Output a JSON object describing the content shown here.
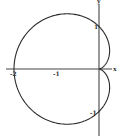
{
  "chart_data": {
    "type": "line",
    "title": "",
    "subtitle": "",
    "xlabel": "x",
    "ylabel": "y",
    "equation": "r = 1 - cos(theta)",
    "x_ticks": [
      {
        "value": -2,
        "label": "-2"
      },
      {
        "value": -1,
        "label": "-1"
      }
    ],
    "y_ticks": [
      {
        "value": 1,
        "label": "1"
      },
      {
        "value": -1,
        "label": "-1"
      }
    ],
    "xlim": [
      -2.2,
      0.4
    ],
    "ylim": [
      -1.5,
      1.6
    ],
    "grid": false,
    "legend": null,
    "series": [
      {
        "name": "cardioid",
        "key_points": [
          {
            "x": 0,
            "y": 0
          },
          {
            "x": 0,
            "y": 1
          },
          {
            "x": -2,
            "y": 0
          },
          {
            "x": 0,
            "y": -1
          },
          {
            "x": -0.75,
            "y": 1.299
          },
          {
            "x": -0.75,
            "y": -1.299
          },
          {
            "x": 0.25,
            "y": 0.433
          },
          {
            "x": 0.25,
            "y": -0.433
          }
        ]
      }
    ],
    "colors": {
      "curve": "#2a2a2a",
      "axes": "#444444",
      "background": "#ffffff"
    }
  },
  "labels": {
    "x_axis": "x",
    "y_axis": "y",
    "tick_neg2": "-2",
    "tick_neg1_x": "-1",
    "tick_pos1_y": "1",
    "tick_neg1_y": "-1"
  }
}
